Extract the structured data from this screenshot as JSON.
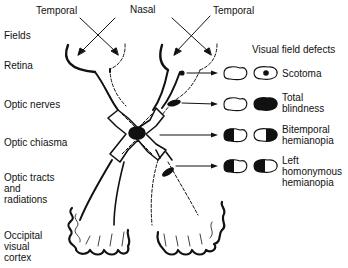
{
  "top_labels": {
    "temporal_left": "Temporal",
    "nasal": "Nasal",
    "temporal_right": "Temporal"
  },
  "left_labels": {
    "fields": "Fields",
    "retina": "Retina",
    "optic_nerves": "Optic nerves",
    "optic_chiasma": "Optic chiasma",
    "optic_tracts": [
      "Optic tracts",
      "and",
      "radiations"
    ],
    "occipital": [
      "Occipital",
      "visual",
      "cortex"
    ]
  },
  "defects": {
    "heading": "Visual field defects",
    "items": [
      {
        "id": "scotoma",
        "lines": [
          "Scotoma"
        ]
      },
      {
        "id": "total-blindness",
        "lines": [
          "Total",
          "blindness"
        ]
      },
      {
        "id": "bitemporal-hemianopia",
        "lines": [
          "Bitemporal",
          "hemianopia"
        ]
      },
      {
        "id": "left-homonymous-hemianopia",
        "lines": [
          "Left",
          "homonymous",
          "hemianopia"
        ]
      }
    ]
  },
  "colors": {
    "ink": "#111111",
    "background": "#ffffff"
  }
}
